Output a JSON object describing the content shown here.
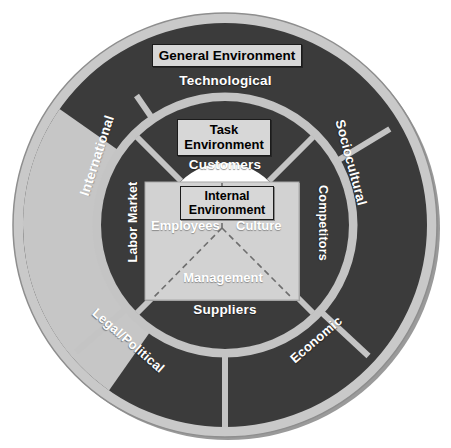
{
  "diagram": {
    "colors": {
      "outer_rim": "#c9c9c9",
      "segment_dark": "#3b3b3b",
      "segment_light": "#c6c6c6",
      "divider": "#bdbdbd",
      "inner_box_fill": "#d2d2d2",
      "label_box_fill": "#d7d7d7",
      "label_box_border": "#1b1b1b",
      "text_white": "#ffffff",
      "text_black": "#000000",
      "dashed_line": "#6e6e6e",
      "background": "#ffffff"
    },
    "label_boxes": {
      "general_environment": "General Environment",
      "task_environment_line1": "Task",
      "task_environment_line2": "Environment",
      "internal_environment_line1": "Internal",
      "internal_environment_line2": "Environment"
    },
    "outer_ring": {
      "name": "General Environment",
      "segments": [
        {
          "label": "Technological",
          "tone": "dark"
        },
        {
          "label": "Sociocultural",
          "tone": "dark"
        },
        {
          "label": "Economic",
          "tone": "dark"
        },
        {
          "label": "Legal/Political",
          "tone": "dark"
        },
        {
          "label": "International",
          "tone": "light"
        }
      ]
    },
    "inner_ring": {
      "name": "Task Environment",
      "segments": [
        {
          "label": "Customers",
          "tone": "dark"
        },
        {
          "label": "Competitors",
          "tone": "dark"
        },
        {
          "label": "Suppliers",
          "tone": "dark"
        },
        {
          "label": "Labor Market",
          "tone": "dark"
        }
      ]
    },
    "core": {
      "name": "Internal Environment",
      "items": [
        {
          "label": "Employees"
        },
        {
          "label": "Culture"
        },
        {
          "label": "Management"
        }
      ]
    }
  }
}
